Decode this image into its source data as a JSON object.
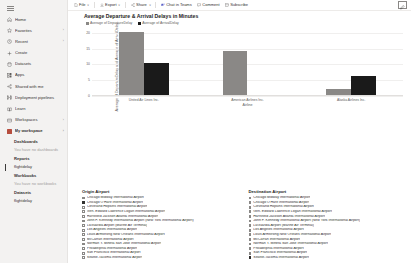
{
  "sidebar": {
    "menu_icon": "hamburger-icon",
    "items": [
      {
        "label": "Home",
        "icon": "home-icon",
        "chevron": ""
      },
      {
        "label": "Favorites",
        "icon": "star-icon",
        "chevron": "›"
      },
      {
        "label": "Recent",
        "icon": "clock-icon",
        "chevron": "›"
      },
      {
        "label": "Create",
        "icon": "plus-icon",
        "chevron": ""
      },
      {
        "label": "Datasets",
        "icon": "database-icon",
        "chevron": ""
      },
      {
        "label": "Apps",
        "icon": "apps-icon",
        "chevron": ""
      },
      {
        "label": "Shared with me",
        "icon": "share-icon",
        "chevron": ""
      },
      {
        "label": "Deployment pipelines",
        "icon": "pipeline-icon",
        "chevron": ""
      },
      {
        "label": "Learn",
        "icon": "book-icon",
        "chevron": ""
      },
      {
        "label": "Workspaces",
        "icon": "workspaces-icon",
        "chevron": "›"
      }
    ],
    "workspace": {
      "label": "My workspace",
      "icon": "workspace-icon",
      "chevron": "›"
    },
    "sections": [
      {
        "title": "Dashboards",
        "items": [
          {
            "label": "You have no dashboards",
            "muted": true
          }
        ]
      },
      {
        "title": "Reports",
        "items": [
          {
            "label": "flightdelay",
            "muted": false,
            "active": true
          }
        ]
      },
      {
        "title": "Workbooks",
        "items": [
          {
            "label": "You have no workbooks",
            "muted": true
          }
        ]
      },
      {
        "title": "Datasets",
        "items": [
          {
            "label": "flightdelay",
            "muted": false
          }
        ]
      }
    ]
  },
  "toolbar": {
    "file_label": "File",
    "export_label": "Export",
    "share_label": "Share",
    "chat_label": "Chat in Teams",
    "comment_label": "Comment",
    "subscribe_label": "Subscribe",
    "edit_label": "Edit",
    "caret": "∨"
  },
  "report": {
    "title": "Average Departure & Arrival Delays in Minutes",
    "legend": [
      {
        "label": "Average of DepartureDelay",
        "color": "#8a8886"
      },
      {
        "label": "Average of ArrivalDelay",
        "color": "#1a1a1a"
      }
    ]
  },
  "chart_data": {
    "type": "bar",
    "title": "Average Departure & Arrival Delays in Minutes",
    "xlabel": "Airline",
    "ylabel": "Average of DepartureDelay and Average of ArrivalDelay",
    "categories": [
      "United Air Lines Inc.",
      "American Airlines Inc.",
      "Alaska Airlines Inc."
    ],
    "series": [
      {
        "name": "Average of DepartureDelay",
        "color": "#8a8886",
        "values": [
          20,
          14,
          2
        ]
      },
      {
        "name": "Average of ArrivalDelay",
        "color": "#1a1a1a",
        "values": [
          10,
          0,
          6
        ]
      }
    ],
    "yticks": [
      0,
      5,
      10,
      15,
      20
    ],
    "ylim": [
      0,
      22
    ],
    "grid": true,
    "legend_position": "top"
  },
  "filters": {
    "origin": {
      "title": "Origin Airport",
      "items": [
        {
          "label": "Chicago Midway International Airport",
          "checked": false
        },
        {
          "label": "Chicago O'Hare International Airport",
          "checked": true
        },
        {
          "label": "Cleveland Hopkins International Airport",
          "checked": false
        },
        {
          "label": "Gen. Edward Lawrence Logan International Airport",
          "checked": false
        },
        {
          "label": "Hartsfield Jackson Atlanta International Airport",
          "checked": false
        },
        {
          "label": "John F. Kennedy International Airport (New York International Airport)",
          "checked": false
        },
        {
          "label": "LaGuardia Airport (Marine Air Terminal)",
          "checked": false
        },
        {
          "label": "Los Angeles International Airport",
          "checked": false
        },
        {
          "label": "Louis Armstrong New Orleans International Airport",
          "checked": false
        },
        {
          "label": "McCarran International Airport",
          "checked": false
        },
        {
          "label": "Norman Y. Mineta San Jose International Airport",
          "checked": false
        },
        {
          "label": "Philadelphia International Airport",
          "checked": false
        },
        {
          "label": "San Francisco International Airport",
          "checked": false
        },
        {
          "label": "Seattle-Tacoma International Airport",
          "checked": false
        }
      ]
    },
    "destination": {
      "title": "Destination Airport",
      "items": [
        {
          "label": "Chicago Midway International Airport",
          "checked": false
        },
        {
          "label": "Chicago O'Hare International Airport",
          "checked": false
        },
        {
          "label": "Cleveland Hopkins International Airport",
          "checked": false
        },
        {
          "label": "Gen. Edward Lawrence Logan International Airport",
          "checked": false
        },
        {
          "label": "Hartsfield Jackson Atlanta International Airport",
          "checked": false
        },
        {
          "label": "John F. Kennedy International Airport (New York International Airport)",
          "checked": false
        },
        {
          "label": "LaGuardia Airport (Marine Air Terminal)",
          "checked": false
        },
        {
          "label": "Los Angeles International Airport",
          "checked": false
        },
        {
          "label": "Louis Armstrong New Orleans International Airport",
          "checked": false
        },
        {
          "label": "McCarran International Airport",
          "checked": false
        },
        {
          "label": "Norman Y. Mineta San Jose International Airport",
          "checked": false
        },
        {
          "label": "Philadelphia International Airport",
          "checked": false
        },
        {
          "label": "San Francisco International Airport",
          "checked": false
        },
        {
          "label": "Seattle-Tacoma International Airport",
          "checked": true
        }
      ]
    }
  }
}
